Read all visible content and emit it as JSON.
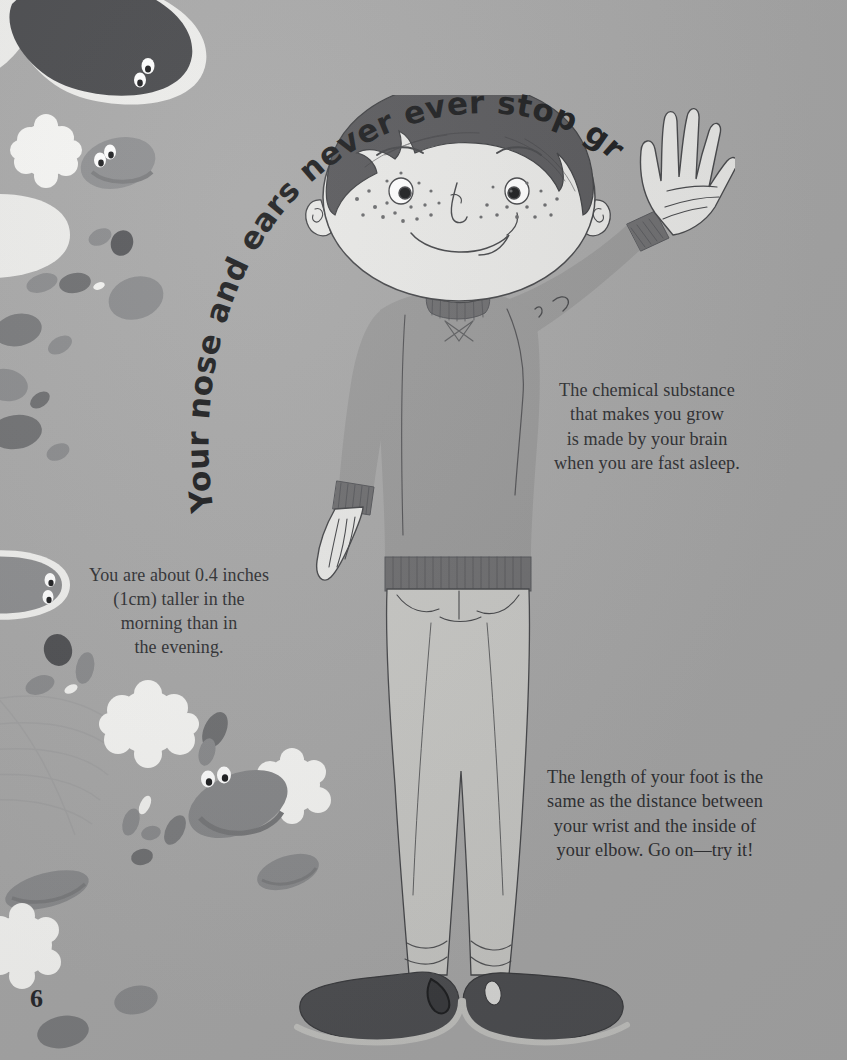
{
  "page": {
    "number": "6",
    "background_color": "#a8a8a8",
    "text_color": "#2f3033",
    "headline_color": "#1d1e20"
  },
  "headline": {
    "text": "Your nose and ears never ever stop growing.",
    "style": "curved-arc"
  },
  "facts": [
    {
      "id": "brain",
      "text": "The chemical substance\nthat makes you grow\nis made by your brain\nwhen you are fast asleep."
    },
    {
      "id": "morning",
      "text": "You are about 0.4 inches\n(1cm) taller in the\nmorning than in\nthe evening."
    },
    {
      "id": "foot",
      "text": "The length of your foot is the\nsame as the distance between\nyour wrist and the inside of\nyour elbow. Go on—try it!"
    }
  ],
  "illustration": {
    "subject": "boy-standing-waving",
    "colors": {
      "skin": "#e9e9e7",
      "hair": "#59595c",
      "sweater": "#9a9a9a",
      "sweater_rib": "#6e6e70",
      "trousers": "#c9c9c6",
      "shoes": "#4e4f52",
      "shoe_sole": "#c3c3c0",
      "outline": "#46474a",
      "germ_dark": "#4a4b4e",
      "germ_mid": "#8c8d8f",
      "germ_light": "#7e7f81",
      "fluff": "#f4f4f2",
      "blob_white": "#ededeb"
    }
  }
}
